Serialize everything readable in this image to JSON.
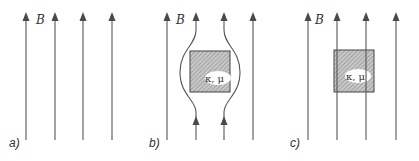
{
  "field_label": "B",
  "material_label": "κ, μ",
  "panels": [
    {
      "id": "a",
      "label": "a)",
      "description": "uniform field lines"
    },
    {
      "id": "b",
      "label": "b)",
      "description": "field lines bend around material"
    },
    {
      "id": "c",
      "label": "c)",
      "description": "field lines pass straight through material"
    }
  ],
  "colors": {
    "line": "#555555",
    "hatch": "#9a9a9a",
    "box_stroke": "#444444"
  }
}
